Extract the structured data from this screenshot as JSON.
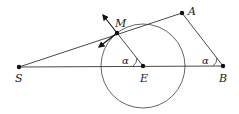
{
  "diagram": {
    "colors": {
      "line": "#333333",
      "circle": "#555555",
      "point": "#111111",
      "background": "#ffffff"
    },
    "points": {
      "S": {
        "label": "S",
        "x": 19,
        "y": 67
      },
      "M": {
        "label": "M",
        "x": 117,
        "y": 33
      },
      "A": {
        "label": "A",
        "x": 182,
        "y": 13
      },
      "E": {
        "label": "E",
        "x": 143,
        "y": 66
      },
      "B": {
        "label": "B",
        "x": 223,
        "y": 66
      }
    },
    "circle": {
      "center": "E",
      "radius": 42
    },
    "angles": {
      "at_E": "α",
      "at_B": "α"
    }
  }
}
